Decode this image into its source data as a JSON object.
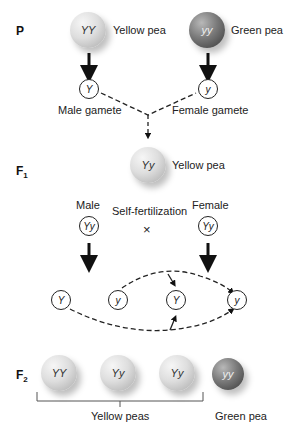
{
  "generations": {
    "p": {
      "label": "P"
    },
    "f1": {
      "label": "F",
      "sub": "1"
    },
    "f2": {
      "label": "F",
      "sub": "2"
    }
  },
  "parents": {
    "yellow": {
      "genotype": "YY",
      "label": "Yellow pea"
    },
    "green": {
      "genotype": "yy",
      "label": "Green pea"
    }
  },
  "parent_gametes": {
    "male": {
      "allele": "Y",
      "label": "Male gamete"
    },
    "female": {
      "allele": "y",
      "label": "Female gamete"
    }
  },
  "f1": {
    "genotype": "Yy",
    "label": "Yellow pea",
    "male_label": "Male",
    "female_label": "Female",
    "male_genotype": "Yy",
    "female_genotype": "Yy",
    "cross_label": "Self-fertilization",
    "cross_symbol": "×"
  },
  "f1_gametes": [
    "Y",
    "y",
    "Y",
    "y"
  ],
  "f2": {
    "offspring": [
      {
        "genotype": "YY",
        "color": "yellow"
      },
      {
        "genotype": "Yy",
        "color": "yellow"
      },
      {
        "genotype": "Yy",
        "color": "yellow"
      },
      {
        "genotype": "yy",
        "color": "green"
      }
    ],
    "yellow_group_label": "Yellow peas",
    "green_label": "Green pea"
  }
}
